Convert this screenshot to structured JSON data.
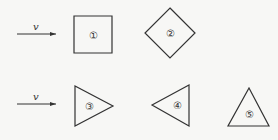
{
  "diagram": {
    "colors": {
      "stroke": "#333333",
      "background": "#f7f7f5"
    },
    "arrows": [
      {
        "label": "v",
        "x1": 17,
        "x2": 56,
        "y": 34
      },
      {
        "label": "v",
        "x1": 17,
        "x2": 56,
        "y": 104
      }
    ],
    "shapes": [
      {
        "id": "1",
        "label": "①",
        "type": "square",
        "points": "74,16 112,16 112,53 74,53",
        "cx": 93,
        "cy": 35
      },
      {
        "id": "2",
        "label": "②",
        "type": "diamond",
        "points": "170,8 195,33 170,58 145,33",
        "cx": 170,
        "cy": 33
      },
      {
        "id": "3",
        "label": "③",
        "type": "triangle-right",
        "points": "75,86 75,126 113,106",
        "cx": 87,
        "cy": 106
      },
      {
        "id": "4",
        "label": "④",
        "type": "triangle-left",
        "points": "152,105 189,85 189,126",
        "cx": 176,
        "cy": 105
      },
      {
        "id": "5",
        "label": "⑤",
        "type": "triangle-up",
        "points": "228,126 269,126 249,88",
        "cx": 249,
        "cy": 114
      }
    ]
  }
}
